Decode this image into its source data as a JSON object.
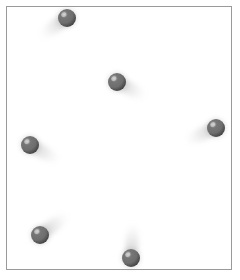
{
  "scene": {
    "title": "Shaded spheres with directional cast shadows",
    "canvas_width": 240,
    "canvas_height": 280,
    "background_color": "#ffffff",
    "sphere_count": 6
  },
  "frame": {
    "name": "image-border",
    "left": 6,
    "top": 6,
    "width": 226,
    "height": 264,
    "border_color": "#9a9a9a",
    "border_width": 1,
    "fill_color": "#ffffff"
  },
  "sphere_style": {
    "base_color": "#6e6e6e",
    "mid_color": "#767676",
    "dark_color": "#4b4b4b",
    "edge_color": "#3f3f3f",
    "highlight_color": "#c9c9c9",
    "shadow_color": "#9b9b9b",
    "radius": 9
  },
  "spheres": [
    {
      "id": "sphere-top",
      "label": "Top sphere",
      "cx": 67,
      "cy": 18,
      "r": 9,
      "highlight_dx": -3.2,
      "highlight_dy": -3.4,
      "shadow_angle_deg": 215,
      "shadow_length": 30,
      "shadow_direction": "lower-left"
    },
    {
      "id": "sphere-upper-center",
      "label": "Upper center sphere",
      "cx": 117,
      "cy": 82,
      "r": 9,
      "highlight_dx": -3.2,
      "highlight_dy": -3.4,
      "shadow_angle_deg": 332,
      "shadow_length": 30,
      "shadow_direction": "lower-right"
    },
    {
      "id": "sphere-left",
      "label": "Left sphere",
      "cx": 30,
      "cy": 145,
      "r": 9,
      "highlight_dx": -3.2,
      "highlight_dy": -3.4,
      "shadow_angle_deg": 331,
      "shadow_length": 31,
      "shadow_direction": "lower-right"
    },
    {
      "id": "sphere-right",
      "label": "Right sphere",
      "cx": 216,
      "cy": 128,
      "r": 9,
      "highlight_dx": -3.2,
      "highlight_dy": -3.4,
      "shadow_angle_deg": 204,
      "shadow_length": 31,
      "shadow_direction": "lower-left"
    },
    {
      "id": "sphere-bottom-left",
      "label": "Bottom left sphere",
      "cx": 40,
      "cy": 235,
      "r": 9,
      "highlight_dx": -3.2,
      "highlight_dy": -3.4,
      "shadow_angle_deg": 36,
      "shadow_length": 32,
      "shadow_direction": "upper-right"
    },
    {
      "id": "sphere-bottom-center",
      "label": "Bottom center sphere",
      "cx": 131,
      "cy": 258,
      "r": 9,
      "highlight_dx": -3.2,
      "highlight_dy": -3.4,
      "shadow_angle_deg": 86,
      "shadow_length": 33,
      "shadow_direction": "upward"
    }
  ]
}
